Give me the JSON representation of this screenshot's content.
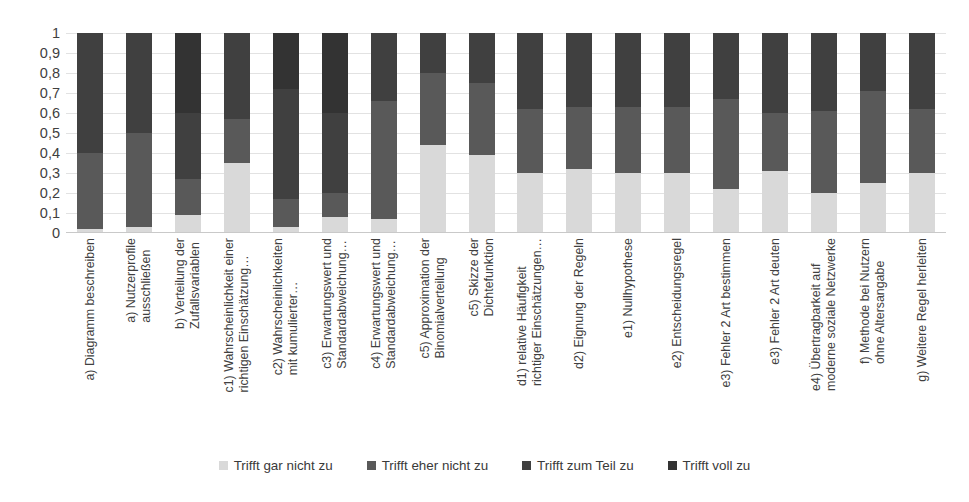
{
  "chart_data": {
    "type": "bar",
    "subtype": "stacked-bar-100",
    "title": "",
    "xlabel": "",
    "ylabel": "",
    "ylim": [
      0,
      1
    ],
    "grid": true,
    "legend_position": "bottom",
    "ytick_labels": [
      "1",
      "0,9",
      "0,8",
      "0,7",
      "0,6",
      "0,5",
      "0,4",
      "0,3",
      "0,2",
      "0,1",
      "0"
    ],
    "ytick_values": [
      1,
      0.9,
      0.8,
      0.7,
      0.6,
      0.5,
      0.4,
      0.3,
      0.2,
      0.1,
      0
    ],
    "categories": [
      "a) Diagramm beschreiben",
      "a) Nutzerprofile\nausschließen",
      "b) Verteilung der\nZufallsvariablen",
      "c1) Wahrscheinlichkeit einer\nrichtigen Einschätzung…",
      "c2) Wahrscheinlichkeiten\nmit kumulierter…",
      "c3) Erwartungswert und\nStandardabweichung…",
      "c4) Erwartungswert und\nStandardabweichung…",
      "c5) Approximation der\nBinomialverteilung",
      "c5) Skizze der\nDichtefunktion",
      "d1) relative Häufigkeit\nrichtiger Einschätzungen…",
      "d2) Eignung der Regeln",
      "e1) Nullhypothese",
      "e2) Entscheidungsregel",
      "e3) Fehler 2 Art bestimmen",
      "e3) Fehler 2 Art deuten",
      "e4) Übertragbarkeit auf\nmoderne soziale Netzwerke",
      "f) Methode bei Nutzern\nohne Altersangabe",
      "g) Weitere Regel herleiten"
    ],
    "series": [
      {
        "name": "Trifft gar nicht zu",
        "color": "#d9d9d9",
        "values": [
          0.02,
          0.03,
          0.09,
          0.35,
          0.03,
          0.08,
          0.07,
          0.44,
          0.39,
          0.3,
          0.32,
          0.3,
          0.3,
          0.22,
          0.31,
          0.2,
          0.25,
          0.3
        ]
      },
      {
        "name": "Trifft eher nicht zu",
        "color": "#595959",
        "values": [
          0.38,
          0.47,
          0.18,
          0.22,
          0.14,
          0.12,
          0.59,
          0.36,
          0.36,
          0.32,
          0.31,
          0.33,
          0.33,
          0.45,
          0.29,
          0.41,
          0.46,
          0.32
        ]
      },
      {
        "name": "Trifft zum Teil zu",
        "color": "#404040",
        "values": [
          0.6,
          0.5,
          0.33,
          0.43,
          0.55,
          0.4,
          0.34,
          0.2,
          0.25,
          0.38,
          0.37,
          0.37,
          0.37,
          0.33,
          0.4,
          0.39,
          0.29,
          0.38
        ]
      },
      {
        "name": "Trifft voll zu",
        "color": "#333333",
        "values": [
          0.0,
          0.0,
          0.4,
          0.0,
          0.28,
          0.4,
          0.0,
          0.0,
          0.0,
          0.0,
          0.0,
          0.0,
          0.0,
          0.0,
          0.0,
          0.0,
          0.0,
          0.0
        ]
      }
    ]
  }
}
